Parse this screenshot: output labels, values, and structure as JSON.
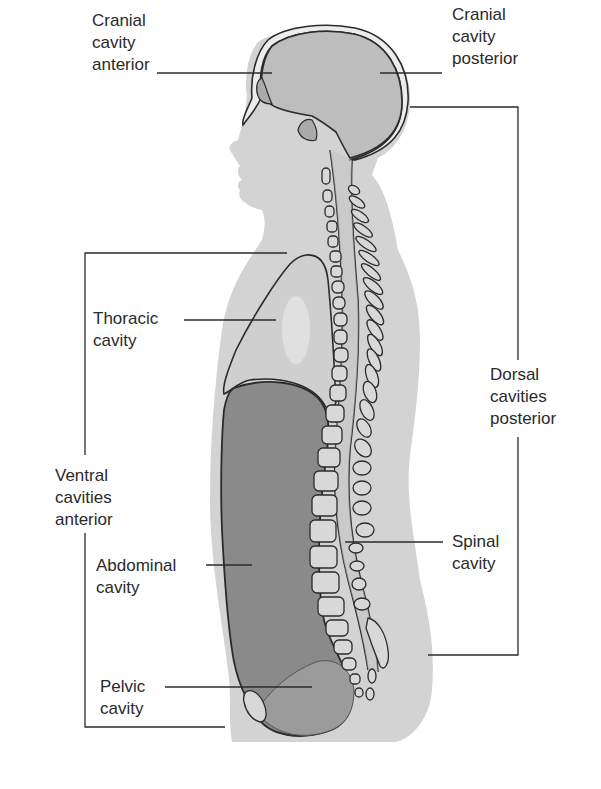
{
  "figure": {
    "colors": {
      "background": "#ffffff",
      "body_silhouette": "#d3d3d3",
      "cranial_fill": "#bdbdbd",
      "thoracic_fill": "#cfcfcf",
      "abdominal_fill": "#8a8a8a",
      "pelvic_fill": "#9b9b9b",
      "outline": "#2b2b2b",
      "label_text": "#2a2a2a"
    },
    "labels": {
      "cranial_anterior": "Cranial\ncavity\nanterior",
      "cranial_posterior": "Cranial\ncavity\nposterior",
      "thoracic": "Thoracic\ncavity",
      "dorsal": "Dorsal\ncavities\nposterior",
      "ventral": "Ventral\ncavities\nanterior",
      "abdominal": "Abdominal\ncavity",
      "spinal": "Spinal\ncavity",
      "pelvic": "Pelvic\ncavity"
    }
  }
}
